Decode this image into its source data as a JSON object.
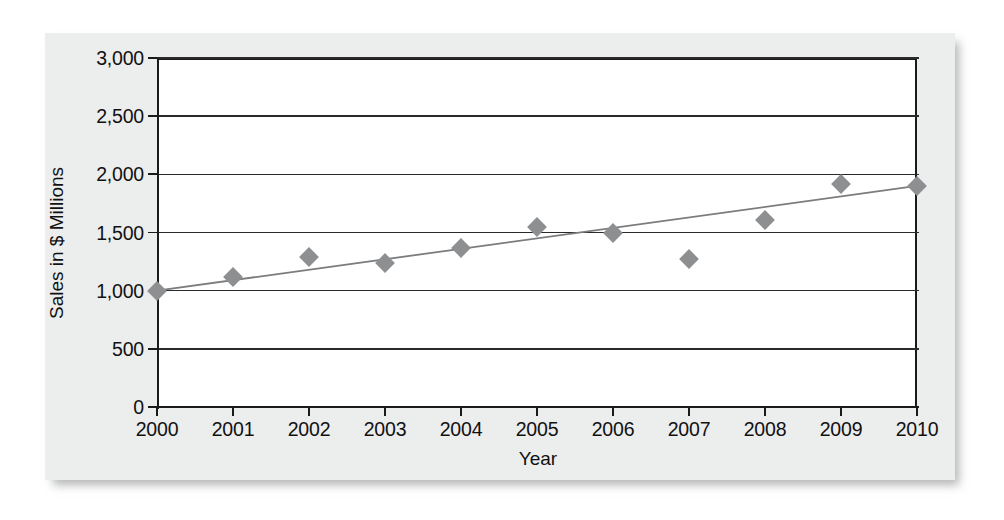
{
  "chart_data": {
    "type": "scatter",
    "title": "",
    "xlabel": "Year",
    "ylabel": "Sales in $ Millions",
    "categories": [
      "2000",
      "2001",
      "2002",
      "2003",
      "2004",
      "2005",
      "2006",
      "2007",
      "2008",
      "2009",
      "2010"
    ],
    "x": [
      2000,
      2001,
      2002,
      2003,
      2004,
      2005,
      2006,
      2007,
      2008,
      2009,
      2010
    ],
    "values": [
      1000,
      1120,
      1290,
      1240,
      1370,
      1550,
      1500,
      1270,
      1610,
      1920,
      1900
    ],
    "series": [
      {
        "name": "Sales",
        "values": [
          1000,
          1120,
          1290,
          1240,
          1370,
          1550,
          1500,
          1270,
          1610,
          1920,
          1900
        ]
      },
      {
        "name": "Trendline",
        "type": "line",
        "endpoints": [
          {
            "x": 2000,
            "y": 1000
          },
          {
            "x": 2010,
            "y": 1900
          }
        ]
      }
    ],
    "xlim": [
      2000,
      2010
    ],
    "ylim": [
      0,
      3000
    ],
    "ytick_labels": [
      "0",
      "500",
      "1,000",
      "1,500",
      "2,000",
      "2,500",
      "3,000"
    ],
    "ytick_values": [
      0,
      500,
      1000,
      1500,
      2000,
      2500,
      3000
    ],
    "xtick_labels": [
      "2000",
      "2001",
      "2002",
      "2003",
      "2004",
      "2005",
      "2006",
      "2007",
      "2008",
      "2009",
      "2010"
    ],
    "grid": true,
    "grid_axis": "y",
    "legend": "none",
    "marker_shape": "diamond",
    "marker_color": "#8d8f91",
    "trendline_color": "#7a7c7e",
    "axis_color": "#1a1a1a",
    "plot_background": "#ffffff",
    "card_background": "#eceded"
  }
}
